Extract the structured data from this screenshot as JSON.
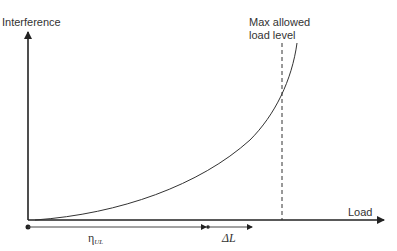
{
  "diagram": {
    "y_axis_label": "Interference",
    "x_axis_label": "Load",
    "max_line_label_line1": "Max allowed",
    "max_line_label_line2": "load level",
    "eta_symbol": "η",
    "eta_subscript": "UL",
    "delta_label": "ΔL",
    "colors": {
      "axis": "#222222",
      "curve": "#333333",
      "text": "#333333"
    }
  }
}
